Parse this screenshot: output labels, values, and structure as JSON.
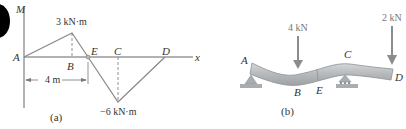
{
  "panel_a": {
    "caption": "(a)",
    "y_axis_label": "M",
    "x_axis_label": "x",
    "points": {
      "A": "A",
      "B": "B",
      "E": "E",
      "C": "C",
      "D": "D"
    },
    "max_moment_label": "3 kN·m",
    "min_moment_label": "−6 kN·m",
    "dimension_label": "4 m"
  },
  "panel_b": {
    "caption": "(b)",
    "load_B": "4 kN",
    "load_D": "2 kN",
    "points": {
      "A": "A",
      "B": "B",
      "C": "C",
      "D": "D",
      "E": "E"
    }
  },
  "colors": {
    "line": "#777777",
    "axis": "#555555",
    "beam": "#b8bcc0",
    "beam_edge": "#8d9296",
    "support": "#9a9ea2",
    "arrow": "#8a8d90"
  }
}
